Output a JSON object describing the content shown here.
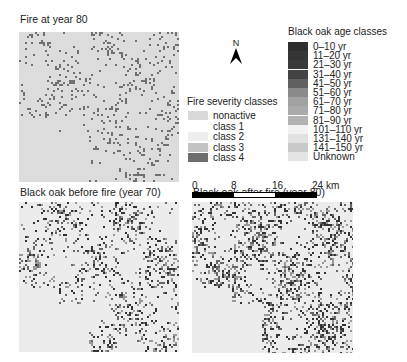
{
  "panels": [
    {
      "title": "Fire at year 80",
      "x": 19,
      "y": 32,
      "w": 160,
      "h": 150,
      "density": 0.18,
      "shade": "#707070",
      "mode": "fire"
    },
    {
      "title": "Black oak before fire (year 70)",
      "x": 19,
      "y": 202,
      "w": 160,
      "h": 150,
      "density": 0.33,
      "shade": "#555555",
      "mode": "oak"
    },
    {
      "title": "Black oak after fire (year 80)",
      "x": 192,
      "y": 202,
      "w": 161,
      "h": 151,
      "density": 0.45,
      "shade": "#4a4a4a",
      "mode": "oak"
    }
  ],
  "north_arrow": {
    "label": "N"
  },
  "fire_legend": {
    "title": "Fire severity classes",
    "items": [
      {
        "label": "nonactive",
        "color": "#d9d9d9"
      },
      {
        "label": "class 1",
        "color": "#ffffff"
      },
      {
        "label": "class 2",
        "color": "#eeeeee"
      },
      {
        "label": "class 3",
        "color": "#c4c4c4"
      },
      {
        "label": "class 4",
        "color": "#6e6e6e"
      }
    ]
  },
  "age_legend": {
    "title": "Black oak age classes",
    "items": [
      {
        "label": "0–10 yr",
        "color": "#2e2e2e"
      },
      {
        "label": "11–20 yr",
        "color": "#353535"
      },
      {
        "label": "21–30 yr",
        "color": "#3a3a3a"
      },
      {
        "label": "31–40 yr",
        "color": "#434343"
      },
      {
        "label": "41–50 yr",
        "color": "#606060"
      },
      {
        "label": "51–60 yr",
        "color": "#8a8a8a"
      },
      {
        "label": "61–70 yr",
        "color": "#a2a2a2"
      },
      {
        "label": "71–80 yr",
        "color": "#aaaaaa"
      },
      {
        "label": "81–90 yr",
        "color": "#b2b2b2"
      },
      {
        "label": "101–110 yr",
        "color": "#f2f2f2"
      },
      {
        "label": "131–140 yr",
        "color": "#e2e2e2"
      },
      {
        "label": "141–150 yr",
        "color": "#c8c8c8"
      },
      {
        "label": "Unknown",
        "color": "#e4e4e4"
      }
    ]
  },
  "scale_bar": {
    "ticks": [
      "0",
      "8",
      "16",
      "24 km"
    ],
    "segments": [
      "#000000",
      "#ffffff",
      "#000000"
    ]
  }
}
